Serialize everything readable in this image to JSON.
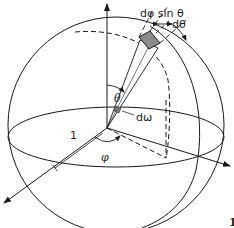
{
  "figure": {
    "type": "solid-angle-spherical-coordinates",
    "labels": {
      "d_phi_sin_theta": "dφ sin θ",
      "d_theta": "dθ",
      "theta": "θ",
      "d_omega": "dω",
      "phi": "φ",
      "radius": "1",
      "figure_number": "1"
    },
    "colors": {
      "stroke": "#1a1a1a",
      "patch_fill": "#8a8a8a",
      "background": "#ffffff"
    }
  }
}
